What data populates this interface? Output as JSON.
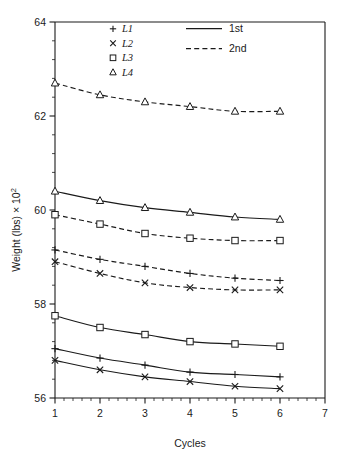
{
  "chart_data": {
    "type": "line",
    "title": "",
    "xlabel": "Cycles",
    "ylabel": "Weight (lbs) × 10²",
    "ylabel_base": "Weight (lbs) × 10",
    "ylabel_exp": "2",
    "x": [
      1,
      2,
      3,
      4,
      5,
      6
    ],
    "xlim": [
      1,
      7
    ],
    "ylim": [
      56,
      64
    ],
    "xticks": [
      1,
      2,
      3,
      4,
      5,
      6,
      7
    ],
    "yticks": [
      56,
      58,
      60,
      62,
      64
    ],
    "xtick_labels": [
      "1",
      "2",
      "3",
      "4",
      "5",
      "6",
      "7"
    ],
    "ytick_labels": [
      "56",
      "58",
      "60",
      "62",
      "64"
    ],
    "x_minor_step": 0.2,
    "y_minor_step": 0.4,
    "grid": false,
    "legend_position": "top-center",
    "series": [
      {
        "name": "L4-2nd",
        "specimen": "L4",
        "run": "2nd",
        "marker": "triangle",
        "linestyle": "dashed",
        "values": [
          62.7,
          62.45,
          62.3,
          62.2,
          62.1,
          62.1
        ]
      },
      {
        "name": "L4-1st",
        "specimen": "L4",
        "run": "1st",
        "marker": "triangle",
        "linestyle": "solid",
        "values": [
          60.4,
          60.2,
          60.05,
          59.95,
          59.85,
          59.8
        ]
      },
      {
        "name": "L3-2nd",
        "specimen": "L3",
        "run": "2nd",
        "marker": "square",
        "linestyle": "dashed",
        "values": [
          59.9,
          59.7,
          59.5,
          59.4,
          59.35,
          59.35
        ]
      },
      {
        "name": "L1-2nd",
        "specimen": "L1",
        "run": "2nd",
        "marker": "plus",
        "linestyle": "dashed",
        "values": [
          59.15,
          58.95,
          58.8,
          58.65,
          58.55,
          58.5
        ]
      },
      {
        "name": "L2-2nd",
        "specimen": "L2",
        "run": "2nd",
        "marker": "cross",
        "linestyle": "dashed",
        "values": [
          58.9,
          58.65,
          58.45,
          58.35,
          58.3,
          58.3
        ]
      },
      {
        "name": "L3-1st",
        "specimen": "L3",
        "run": "1st",
        "marker": "square",
        "linestyle": "solid",
        "values": [
          57.75,
          57.5,
          57.35,
          57.2,
          57.15,
          57.1
        ]
      },
      {
        "name": "L1-1st",
        "specimen": "L1",
        "run": "1st",
        "marker": "plus",
        "linestyle": "solid",
        "values": [
          57.05,
          56.85,
          56.7,
          56.55,
          56.5,
          56.45
        ]
      },
      {
        "name": "L2-1st",
        "specimen": "L2",
        "run": "1st",
        "marker": "cross",
        "linestyle": "solid",
        "values": [
          56.8,
          56.6,
          56.45,
          56.35,
          56.25,
          56.2
        ]
      }
    ],
    "legend_markers": [
      {
        "glyph": "plus",
        "label": "L1"
      },
      {
        "glyph": "cross",
        "label": "L2"
      },
      {
        "glyph": "square",
        "label": "L3"
      },
      {
        "glyph": "triangle",
        "label": "L4"
      }
    ],
    "legend_lines": [
      {
        "style": "solid",
        "label": "1st"
      },
      {
        "style": "dashed",
        "label": "2nd"
      }
    ],
    "colors": {
      "ink": "#1a1a1a",
      "background": "#ffffff",
      "marker_fill": "#ffffff"
    }
  }
}
